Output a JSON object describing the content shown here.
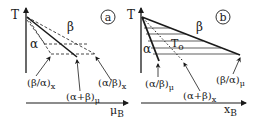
{
  "panels": [
    {
      "id": "a",
      "badge": "a",
      "y_axis_label": "T",
      "x_axis_label": "μ",
      "x_axis_sub": "B",
      "region_top": "β",
      "region_left": "α",
      "annotations": [
        {
          "text": "(β/α)",
          "sub": "x"
        },
        {
          "text": "(α+β)",
          "sub": "μ"
        },
        {
          "text": "(α/β)",
          "sub": "x"
        }
      ]
    },
    {
      "id": "b",
      "badge": "b",
      "y_axis_label": "T",
      "x_axis_label": "x",
      "x_axis_sub": "B",
      "region_top": "β",
      "region_left": "α",
      "inner_label": "T",
      "inner_label_sub": "o",
      "annotations": [
        {
          "text": "(α/β)",
          "sub": "μ"
        },
        {
          "text": "(α+β)",
          "sub": "x"
        },
        {
          "text": "(β/α)",
          "sub": "μ"
        }
      ]
    }
  ],
  "colors": {
    "ink": "#1a1a1a",
    "background": "#ffffff"
  }
}
